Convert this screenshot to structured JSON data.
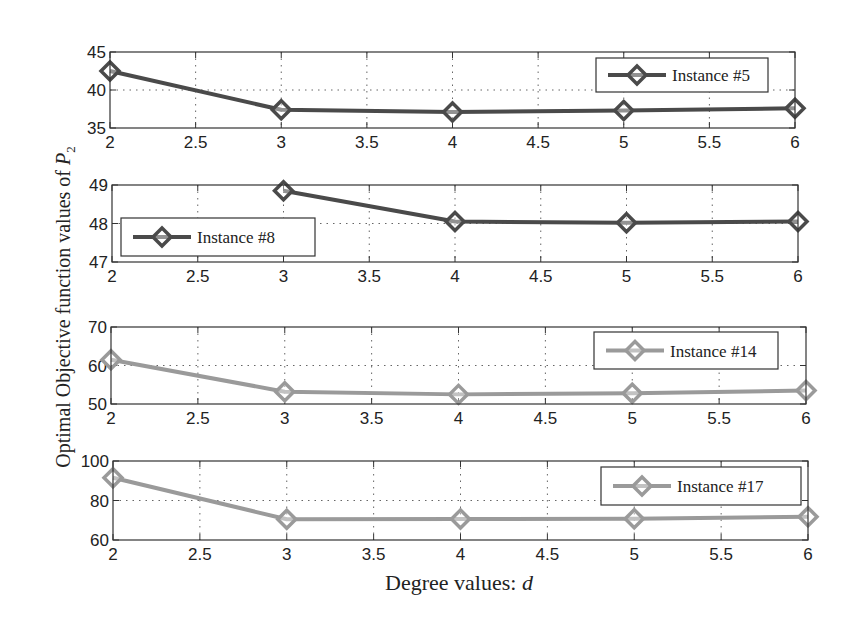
{
  "chart_data": [
    {
      "type": "line",
      "title": "",
      "xlabel": "Degree values: d",
      "ylabel": "Optimal Objective function values of P2",
      "x_ticks": [
        "2",
        "2.5",
        "3",
        "3.5",
        "4",
        "4.5",
        "5",
        "5.5",
        "6"
      ],
      "y_ticks": [
        "35",
        "40",
        "45"
      ],
      "xlim": [
        2,
        6
      ],
      "ylim": [
        35,
        45
      ],
      "grid": true,
      "legend_position": "upper right",
      "series": [
        {
          "name": "Instance #5",
          "color": "#4a4a4a",
          "marker": "diamond",
          "x": [
            2,
            3,
            4,
            5,
            6
          ],
          "values": [
            42.5,
            37.4,
            37.1,
            37.3,
            37.6
          ]
        }
      ]
    },
    {
      "type": "line",
      "title": "",
      "xlabel": "",
      "ylabel": "",
      "x_ticks": [
        "2",
        "2.5",
        "3",
        "3.5",
        "4",
        "4.5",
        "5",
        "5.5",
        "6"
      ],
      "y_ticks": [
        "47",
        "48",
        "49"
      ],
      "xlim": [
        2,
        6
      ],
      "ylim": [
        47,
        49
      ],
      "grid": true,
      "legend_position": "lower left",
      "series": [
        {
          "name": "Instance #8",
          "color": "#4a4a4a",
          "marker": "diamond",
          "x": [
            3,
            4,
            5,
            6
          ],
          "values": [
            48.85,
            48.05,
            48.02,
            48.05
          ]
        }
      ]
    },
    {
      "type": "line",
      "title": "",
      "xlabel": "",
      "ylabel": "",
      "x_ticks": [
        "2",
        "2.5",
        "3",
        "3.5",
        "4",
        "4.5",
        "5",
        "5.5",
        "6"
      ],
      "y_ticks": [
        "50",
        "60",
        "70"
      ],
      "xlim": [
        2,
        6
      ],
      "ylim": [
        50,
        70
      ],
      "grid": true,
      "legend_position": "upper right",
      "series": [
        {
          "name": "Instance #14",
          "color": "#9a9a9a",
          "marker": "diamond",
          "x": [
            2,
            3,
            4,
            5,
            6
          ],
          "values": [
            61.5,
            53.2,
            52.5,
            52.8,
            53.5
          ]
        }
      ]
    },
    {
      "type": "line",
      "title": "",
      "xlabel": "Degree values: d",
      "ylabel": "",
      "x_ticks": [
        "2",
        "2.5",
        "3",
        "3.5",
        "4",
        "4.5",
        "5",
        "5.5",
        "6"
      ],
      "y_ticks": [
        "60",
        "80",
        "100"
      ],
      "xlim": [
        2,
        6
      ],
      "ylim": [
        60,
        100
      ],
      "grid": true,
      "legend_position": "upper right",
      "series": [
        {
          "name": "Instance #17",
          "color": "#9a9a9a",
          "marker": "diamond",
          "x": [
            2,
            3,
            4,
            5,
            6
          ],
          "values": [
            91.5,
            70.5,
            70.6,
            70.8,
            71.8
          ]
        }
      ]
    }
  ],
  "labels": {
    "ylabel_main": "Optimal Objective function values of ",
    "ylabel_var": "P",
    "ylabel_sub": "2",
    "xlabel_main": "Degree values: ",
    "xlabel_var": "d"
  }
}
